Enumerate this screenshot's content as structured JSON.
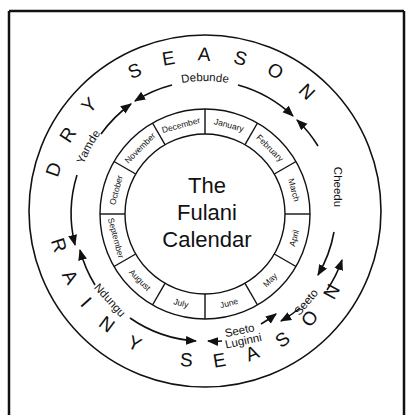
{
  "title": {
    "line1": "The",
    "line2": "Fulani",
    "line3": "Calendar"
  },
  "seasons": {
    "dry": {
      "word1": "DRY",
      "word2": "SEASON"
    },
    "rainy": {
      "word1": "RAINY",
      "word2": "SEASON"
    }
  },
  "months": [
    "January",
    "February",
    "March",
    "April",
    "May",
    "June",
    "July",
    "August",
    "September",
    "October",
    "November",
    "December"
  ],
  "fulani_seasons": {
    "debunde": "Debunde",
    "cheedu": "Cheedu",
    "seeto": "Seeto",
    "seeto_luginni_line1": "Seeto",
    "seeto_luginni_line2": "Luginni",
    "ndungu": "Ndungu",
    "yamde": "Yamde"
  },
  "colors": {
    "ink": "#111111",
    "background": "#ffffff"
  }
}
